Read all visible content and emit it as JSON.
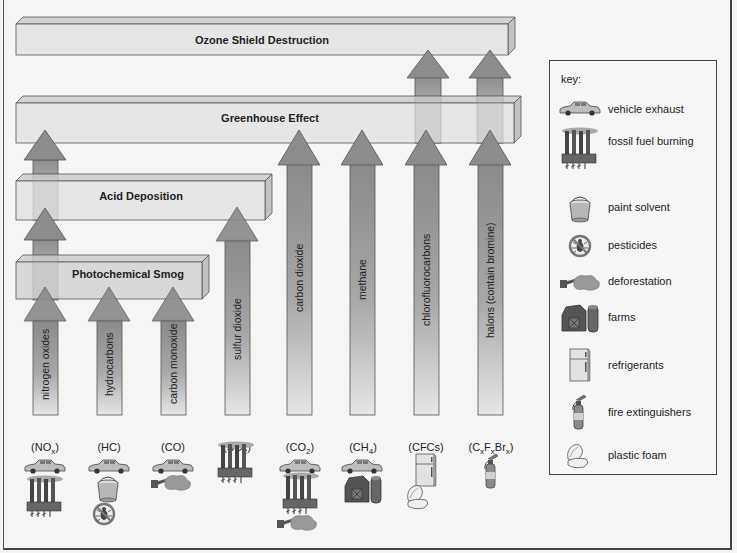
{
  "diagram": {
    "bars": {
      "ozone": "Ozone Shield Destruction",
      "greenhouse": "Greenhouse Effect",
      "acid": "Acid Deposition",
      "smog": "Photochemical Smog"
    },
    "pollutants": [
      {
        "name": "nitrogen oxides",
        "formula": "(NOx)",
        "effects": [
          "Photochemical Smog",
          "Acid Deposition",
          "Greenhouse Effect"
        ],
        "sources": [
          "vehicle exhaust",
          "fossil fuel burning"
        ]
      },
      {
        "name": "hydrocarbons",
        "formula": "(HC)",
        "effects": [
          "Photochemical Smog"
        ],
        "sources": [
          "vehicle exhaust",
          "paint solvent",
          "pesticides"
        ]
      },
      {
        "name": "carbon monoxide",
        "formula": "(CO)",
        "effects": [
          "Photochemical Smog"
        ],
        "sources": [
          "vehicle exhaust",
          "deforestation"
        ]
      },
      {
        "name": "sulfur dioxide",
        "formula": "(SO2)",
        "effects": [
          "Acid Deposition"
        ],
        "sources": [
          "fossil fuel burning"
        ]
      },
      {
        "name": "carbon dioxide",
        "formula": "(CO2)",
        "effects": [
          "Greenhouse Effect"
        ],
        "sources": [
          "vehicle exhaust",
          "fossil fuel burning",
          "deforestation"
        ]
      },
      {
        "name": "methane",
        "formula": "(CH4)",
        "effects": [
          "Greenhouse Effect"
        ],
        "sources": [
          "vehicle exhaust",
          "farms"
        ]
      },
      {
        "name": "chlorofluorocarbons",
        "formula": "(CFCs)",
        "effects": [
          "Greenhouse Effect",
          "Ozone Shield Destruction"
        ],
        "sources": [
          "refrigerants",
          "plastic foam"
        ]
      },
      {
        "name": "halons (contain bromine)",
        "formula": "(CxFxBrx)",
        "effects": [
          "Greenhouse Effect",
          "Ozone Shield Destruction"
        ],
        "sources": [
          "fire extinguishers"
        ]
      }
    ],
    "formulas": {
      "nox": {
        "base": "(NO",
        "sub": "x",
        "end": ")"
      },
      "hc": "(HC)",
      "co": "(CO)",
      "so2": {
        "base": "(SO",
        "sub": "2",
        "end": ")"
      },
      "co2": {
        "base": "(CO",
        "sub": "2",
        "end": ")"
      },
      "ch4": {
        "base": "(CH",
        "sub": "4",
        "end": ")"
      },
      "cfcs": "(CFCs)",
      "halon": {
        "c": "(C",
        "s1": "x",
        "f": "F",
        "s2": "x",
        "br": "Br",
        "s3": "x",
        "end": ")"
      }
    }
  },
  "key": {
    "title": "key:",
    "items": [
      {
        "icon": "car-icon",
        "label": "vehicle exhaust"
      },
      {
        "icon": "factory-icon",
        "label": "fossil fuel burning"
      },
      {
        "icon": "paint-bucket-icon",
        "label": "paint solvent"
      },
      {
        "icon": "no-bug-icon",
        "label": "pesticides"
      },
      {
        "icon": "stump-icon",
        "label": "deforestation"
      },
      {
        "icon": "barn-silo-icon",
        "label": "farms"
      },
      {
        "icon": "refrigerator-icon",
        "label": "refrigerants"
      },
      {
        "icon": "fire-extinguisher-icon",
        "label": "fire extinguishers"
      },
      {
        "icon": "foam-container-icon",
        "label": "plastic foam"
      }
    ]
  },
  "colors": {
    "bar_front": "#e6e6e6",
    "bar_top": "#d2d2d2",
    "bar_side": "#c4c4c4",
    "arrow_top": "#8c8c8c",
    "arrow_bottom": "#e4e4e4",
    "outline": "#555555"
  }
}
